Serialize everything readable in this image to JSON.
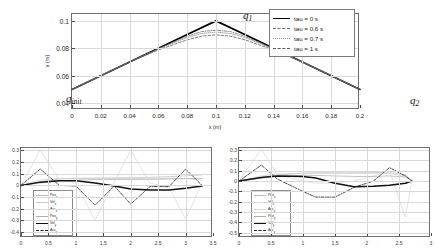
{
  "figure": {
    "background": "#ffffff",
    "accent": "#000000"
  },
  "main_plot": {
    "xlabel": "x (m)",
    "ylabel": "y (m)",
    "xticks": [
      "0",
      "0.02",
      "0.04",
      "0.06",
      "0.08",
      "0.1",
      "0.12",
      "0.14",
      "0.16",
      "0.18",
      "0.2"
    ],
    "yticks": [
      "0.04",
      "0.06",
      "0.08",
      "0.1"
    ],
    "xlim": [
      0,
      0.2
    ],
    "ylim": [
      0.035,
      0.105
    ],
    "annotations": [
      {
        "name": "q-init",
        "base": "q",
        "sub": "init"
      },
      {
        "name": "q-one",
        "base": "q",
        "sub": "1"
      },
      {
        "name": "q-two",
        "base": "q",
        "sub": "2"
      }
    ],
    "legend": {
      "entries": [
        {
          "label": "tau = 0 s",
          "style": "solid",
          "color": "#000000",
          "width": 1.7
        },
        {
          "label": "tau = 0.6 s",
          "style": "dashdot",
          "color": "#6a6a6a",
          "width": 0.8
        },
        {
          "label": "tau = 0.7 s",
          "style": "dotted",
          "color": "#8c8c8c",
          "width": 0.8
        },
        {
          "label": "tau = 1 s",
          "style": "dashed",
          "color": "#5a5a5a",
          "width": 0.8
        }
      ]
    }
  },
  "subplot_left": {
    "xticks": [
      "0",
      "0.5",
      "1",
      "1.5",
      "2",
      "2.5",
      "3",
      "3.5"
    ],
    "yticks": [
      "0.3",
      "0.2",
      "0.1",
      "0",
      "-0.1",
      "-0.2",
      "-0.3",
      "-0.4"
    ],
    "xlim": [
      0,
      3.5
    ],
    "ylim": [
      -0.45,
      0.32
    ],
    "legend": {
      "entries": [
        {
          "label": "Pos",
          "sub": "x",
          "style": "solid",
          "color": "#b9b9b9",
          "width": 0.7
        },
        {
          "label": "Vel",
          "sub": "x",
          "style": "solid",
          "color": "#c9c9c9",
          "width": 0.7
        },
        {
          "label": "Acc",
          "sub": "x",
          "style": "solid",
          "color": "#d6d6d6",
          "width": 0.7
        },
        {
          "label": "Pos",
          "sub": "y",
          "style": "solid",
          "color": "#b0b0b0",
          "width": 0.7
        },
        {
          "label": "Vel",
          "sub": "y",
          "style": "solid",
          "color": "#111111",
          "width": 1.6
        },
        {
          "label": "Acc",
          "sub": "y",
          "style": "dashdot",
          "color": "#222222",
          "width": 0.9
        }
      ]
    }
  },
  "subplot_right": {
    "xticks": [
      "0",
      "0.5",
      "1",
      "1.5",
      "2",
      "2.5",
      "3"
    ],
    "yticks": [
      "0.3",
      "0.2",
      "0.1",
      "0",
      "-0.1",
      "-0.2",
      "-0.3",
      "-0.4",
      "-0.5"
    ],
    "xlim": [
      0,
      3
    ],
    "ylim": [
      -0.55,
      0.32
    ],
    "legend": {
      "entries": [
        {
          "label": "Pos",
          "sub": "x",
          "style": "solid",
          "color": "#b9b9b9",
          "width": 0.7
        },
        {
          "label": "Vel",
          "sub": "x",
          "style": "solid",
          "color": "#c9c9c9",
          "width": 0.7
        },
        {
          "label": "Acc",
          "sub": "x",
          "style": "solid",
          "color": "#d6d6d6",
          "width": 0.7
        },
        {
          "label": "Pos",
          "sub": "y",
          "style": "solid",
          "color": "#b0b0b0",
          "width": 0.7
        },
        {
          "label": "Vel",
          "sub": "y",
          "style": "solid",
          "color": "#111111",
          "width": 1.6
        },
        {
          "label": "Acc",
          "sub": "y",
          "style": "dashdot",
          "color": "#222222",
          "width": 0.9
        }
      ]
    }
  },
  "chart_data": [
    {
      "id": "trajectory",
      "type": "line",
      "title": "",
      "xlabel": "x (m)",
      "ylabel": "y (m)",
      "xlim": [
        0,
        0.2
      ],
      "ylim": [
        0.035,
        0.105
      ],
      "grid": true,
      "legend_position": "upper right",
      "annotations": [
        {
          "text": "q_init",
          "x": 0.003,
          "y": 0.0435
        },
        {
          "text": "q_1",
          "x": 0.098,
          "y": 0.1035
        },
        {
          "text": "q_2",
          "x": 0.193,
          "y": 0.0445
        }
      ],
      "series": [
        {
          "name": "tau = 0 s",
          "style": "solid",
          "color": "#000000",
          "x": [
            0,
            0.02,
            0.04,
            0.06,
            0.08,
            0.1,
            0.12,
            0.14,
            0.16,
            0.18,
            0.2
          ],
          "y": [
            0.05,
            0.06,
            0.07,
            0.08,
            0.09,
            0.1,
            0.09,
            0.08,
            0.07,
            0.06,
            0.05
          ]
        },
        {
          "name": "tau = 0.6 s",
          "style": "dashdot",
          "color": "#6a6a6a",
          "x": [
            0,
            0.02,
            0.04,
            0.06,
            0.08,
            0.09,
            0.1,
            0.11,
            0.12,
            0.14,
            0.16,
            0.18,
            0.2
          ],
          "y": [
            0.05,
            0.06,
            0.07,
            0.0798,
            0.0888,
            0.0922,
            0.0932,
            0.0922,
            0.0888,
            0.0798,
            0.07,
            0.06,
            0.05
          ]
        },
        {
          "name": "tau = 0.7 s",
          "style": "dotted",
          "color": "#8c8c8c",
          "x": [
            0,
            0.02,
            0.04,
            0.06,
            0.08,
            0.09,
            0.1,
            0.11,
            0.12,
            0.14,
            0.16,
            0.18,
            0.2
          ],
          "y": [
            0.05,
            0.06,
            0.07,
            0.0795,
            0.0878,
            0.0908,
            0.0918,
            0.0908,
            0.0878,
            0.0795,
            0.07,
            0.06,
            0.05
          ]
        },
        {
          "name": "tau = 1 s",
          "style": "dashed",
          "color": "#5a5a5a",
          "x": [
            0,
            0.02,
            0.04,
            0.06,
            0.08,
            0.09,
            0.1,
            0.11,
            0.12,
            0.14,
            0.16,
            0.18,
            0.2
          ],
          "y": [
            0.05,
            0.06,
            0.07,
            0.0788,
            0.0862,
            0.0888,
            0.0898,
            0.0888,
            0.0862,
            0.0788,
            0.07,
            0.06,
            0.05
          ]
        }
      ]
    },
    {
      "id": "profiles-left",
      "type": "line",
      "title": "",
      "xlabel": "",
      "ylabel": "",
      "xlim": [
        0,
        3.5
      ],
      "ylim": [
        -0.45,
        0.32
      ],
      "grid": true,
      "legend_position": "lower left",
      "series": [
        {
          "name": "Pos_x",
          "style": "solid",
          "color": "#c4c4c4",
          "x": [
            0,
            0.35,
            0.7,
            1.0,
            1.35,
            1.7,
            2.0,
            2.35,
            2.7,
            3.0,
            3.3
          ],
          "y": [
            0.0,
            0.03,
            0.055,
            0.06,
            0.062,
            0.064,
            0.066,
            0.07,
            0.075,
            0.082,
            0.09
          ]
        },
        {
          "name": "Vel_x",
          "style": "solid",
          "color": "#cfcfcf",
          "x": [
            0,
            0.35,
            0.7,
            1.0,
            1.35,
            1.7,
            2.0,
            2.35,
            2.7,
            3.0,
            3.3
          ],
          "y": [
            0.0,
            0.045,
            0.06,
            0.06,
            0.06,
            0.06,
            0.06,
            0.06,
            0.06,
            0.06,
            0.045
          ]
        },
        {
          "name": "Acc_x",
          "style": "solid",
          "color": "#dcdcdc",
          "x": [
            0,
            0.35,
            0.7,
            1.0,
            1.35,
            1.7,
            2.0,
            2.35,
            2.7,
            3.0,
            3.3
          ],
          "y": [
            0.0,
            0.3,
            0.05,
            0.02,
            -0.3,
            0.03,
            0.3,
            0.02,
            -0.02,
            -0.29,
            0.02
          ]
        },
        {
          "name": "Pos_y",
          "style": "solid",
          "color": "#b5b5b5",
          "x": [
            0,
            0.35,
            0.7,
            1.0,
            1.35,
            1.7,
            2.0,
            2.35,
            2.7,
            3.0,
            3.3
          ],
          "y": [
            0.0,
            0.02,
            0.04,
            0.045,
            0.05,
            0.05,
            0.05,
            0.052,
            0.055,
            0.058,
            0.06
          ]
        },
        {
          "name": "Vel_y",
          "style": "solid",
          "color": "#111111",
          "x": [
            0,
            0.35,
            0.7,
            1.0,
            1.35,
            1.7,
            2.0,
            2.35,
            2.7,
            3.0,
            3.3
          ],
          "y": [
            0.0,
            0.028,
            0.04,
            0.04,
            0.02,
            -0.005,
            -0.03,
            -0.04,
            -0.04,
            -0.025,
            -0.005
          ]
        },
        {
          "name": "Acc_y",
          "style": "dashdot",
          "color": "#1c1c1c",
          "x": [
            0,
            0.35,
            0.7,
            1.0,
            1.35,
            1.7,
            2.0,
            2.35,
            2.7,
            3.0,
            3.3
          ],
          "y": [
            0.0,
            0.14,
            0.0,
            -0.005,
            -0.17,
            -0.005,
            -0.16,
            -0.01,
            -0.01,
            0.14,
            0.0
          ]
        }
      ]
    },
    {
      "id": "profiles-right",
      "type": "line",
      "title": "",
      "xlabel": "",
      "ylabel": "",
      "xlim": [
        0,
        3
      ],
      "ylim": [
        -0.55,
        0.32
      ],
      "grid": true,
      "legend_position": "lower left",
      "series": [
        {
          "name": "Pos_x",
          "style": "solid",
          "color": "#c4c4c4",
          "x": [
            0,
            0.35,
            0.6,
            1.0,
            1.2,
            1.5,
            1.8,
            2.1,
            2.35,
            2.6,
            2.7
          ],
          "y": [
            0.0,
            0.04,
            0.06,
            0.075,
            0.08,
            0.08,
            0.08,
            0.082,
            0.085,
            0.06,
            0.01
          ]
        },
        {
          "name": "Vel_x",
          "style": "solid",
          "color": "#cfcfcf",
          "x": [
            0,
            0.35,
            0.6,
            1.0,
            1.2,
            1.5,
            1.8,
            2.1,
            2.35,
            2.6,
            2.7
          ],
          "y": [
            0.0,
            0.05,
            0.07,
            0.075,
            0.075,
            0.075,
            0.075,
            0.075,
            0.075,
            0.05,
            0.0
          ]
        },
        {
          "name": "Acc_x",
          "style": "solid",
          "color": "#dcdcdc",
          "x": [
            0,
            0.35,
            0.6,
            1.0,
            1.2,
            1.5,
            1.8,
            2.1,
            2.35,
            2.6,
            2.7
          ],
          "y": [
            0.0,
            0.31,
            0.06,
            0.0,
            -0.02,
            -0.02,
            0.0,
            0.05,
            0.1,
            -0.35,
            0.0
          ]
        },
        {
          "name": "Pos_y",
          "style": "solid",
          "color": "#b5b5b5",
          "x": [
            0,
            0.35,
            0.6,
            1.0,
            1.2,
            1.5,
            1.8,
            2.1,
            2.35,
            2.6,
            2.7
          ],
          "y": [
            0.0,
            0.03,
            0.05,
            0.055,
            0.055,
            0.05,
            0.045,
            0.045,
            0.05,
            0.04,
            0.01
          ]
        },
        {
          "name": "Vel_y",
          "style": "solid",
          "color": "#111111",
          "x": [
            0,
            0.35,
            0.6,
            1.0,
            1.2,
            1.5,
            1.8,
            2.1,
            2.35,
            2.6,
            2.7
          ],
          "y": [
            0.0,
            0.035,
            0.05,
            0.045,
            0.03,
            -0.02,
            -0.055,
            -0.05,
            -0.04,
            -0.02,
            0.0
          ]
        },
        {
          "name": "Acc_y",
          "style": "dashdot",
          "color": "#1c1c1c",
          "x": [
            0,
            0.35,
            0.6,
            1.0,
            1.2,
            1.5,
            1.8,
            2.1,
            2.35,
            2.6,
            2.7
          ],
          "y": [
            0.0,
            0.155,
            0.02,
            -0.1,
            -0.155,
            -0.155,
            -0.06,
            0.0,
            0.13,
            0.05,
            0.0
          ]
        }
      ]
    }
  ]
}
